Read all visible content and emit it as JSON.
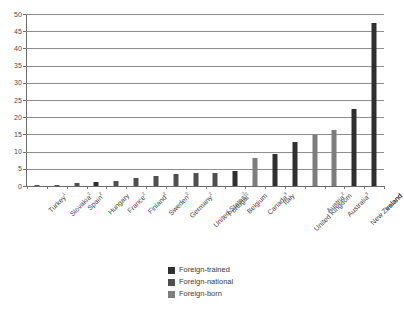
{
  "chart_data": {
    "type": "bar",
    "title": "",
    "subtitle": "",
    "xlabel": "",
    "ylabel": "",
    "ylim": [
      0,
      50
    ],
    "ytick_step": 5,
    "yticks": [
      "0",
      "5",
      "10",
      "15",
      "20",
      "25",
      "30",
      "35",
      "40",
      "45",
      "50"
    ],
    "grid": true,
    "legend_position": "bottom-center",
    "categories": [
      "Turkey",
      "Slovakia",
      "Spain",
      "Hungary",
      "France",
      "Finland",
      "Sweden",
      "Germany",
      "United States",
      "Portugal",
      "Belgium",
      "Canada",
      "Italy",
      "United Kingdom",
      "Austria",
      "Australia",
      "New Zealand",
      "Ireland"
    ],
    "category_footnotes": [
      "1",
      "2",
      "2",
      "",
      "2",
      "2",
      "2",
      "2",
      "2",
      "2",
      "",
      "3",
      "",
      "",
      "2",
      "3",
      "",
      ""
    ],
    "values": [
      0.1,
      0.2,
      0.9,
      1.2,
      1.5,
      2.3,
      2.8,
      3.6,
      3.7,
      3.7,
      4.5,
      8.0,
      9.4,
      12.9,
      14.8,
      16.4,
      22.3,
      47.3
    ],
    "point_series": [
      "foreign-national",
      "foreign-national",
      "foreign-national",
      "foreign-trained",
      "foreign-national",
      "foreign-national",
      "foreign-national",
      "foreign-national",
      "foreign-national",
      "foreign-national",
      "foreign-trained",
      "foreign-born",
      "foreign-trained",
      "foreign-trained",
      "foreign-born",
      "foreign-born",
      "foreign-trained",
      "foreign-trained"
    ],
    "legend": [
      {
        "label": "Foreign-trained",
        "color": "#2f2f2f",
        "key": "foreign-trained"
      },
      {
        "label": "Foreign-national",
        "color": "#4f4f4f",
        "key": "foreign-national"
      },
      {
        "label": "Foreign-born",
        "color": "#7d7d7d",
        "key": "foreign-born"
      }
    ]
  }
}
